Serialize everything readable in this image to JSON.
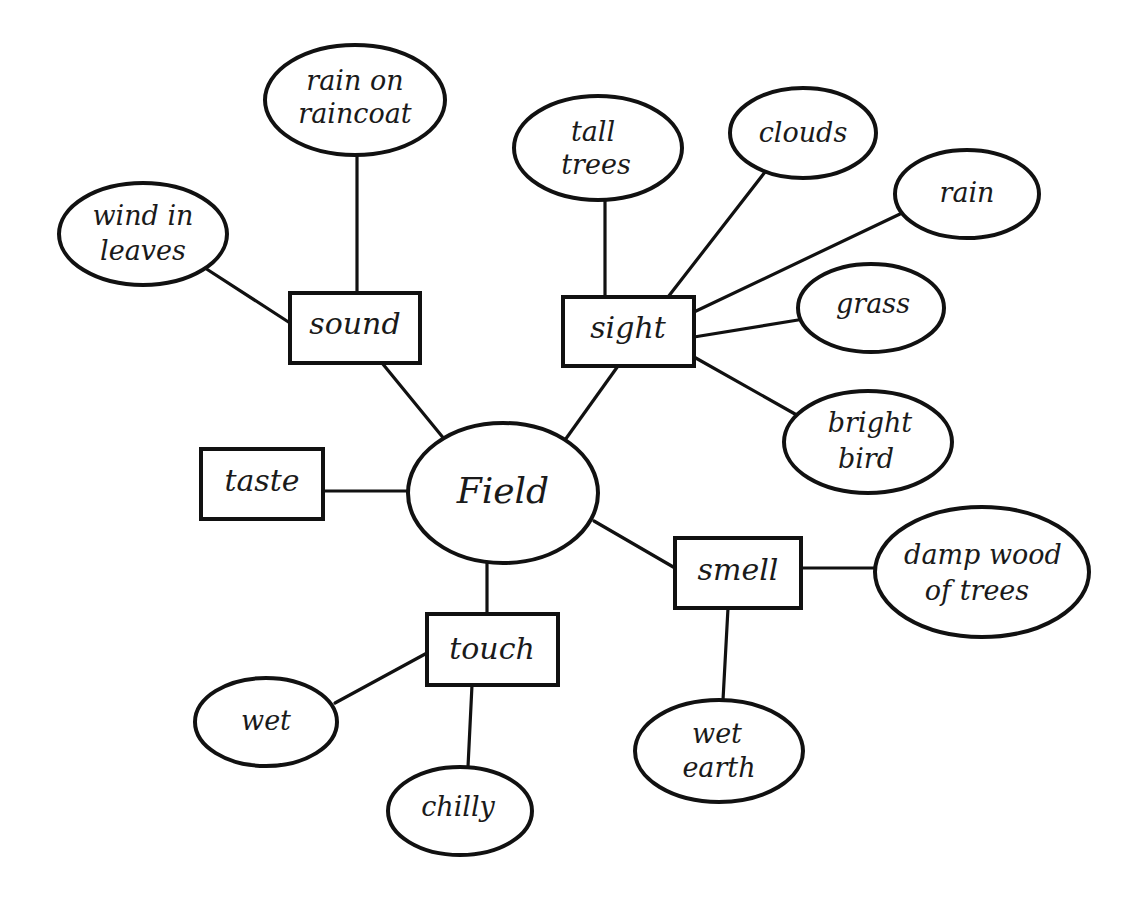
{
  "diagram": {
    "type": "concept-web",
    "center": {
      "id": "field",
      "label": "Field"
    },
    "categories": [
      {
        "id": "sound",
        "label": "sound"
      },
      {
        "id": "sight",
        "label": "sight"
      },
      {
        "id": "taste",
        "label": "taste"
      },
      {
        "id": "smell",
        "label": "smell"
      },
      {
        "id": "touch",
        "label": "touch"
      }
    ],
    "details": {
      "rain_on_raincoat": {
        "lines": [
          "rain on",
          "raincoat"
        ],
        "category": "sound"
      },
      "wind_in_leaves": {
        "lines": [
          "wind in",
          "leaves"
        ],
        "category": "sound"
      },
      "tall_trees": {
        "lines": [
          "tall",
          "trees"
        ],
        "category": "sight"
      },
      "clouds": {
        "lines": [
          "clouds"
        ],
        "category": "sight"
      },
      "rain": {
        "lines": [
          "rain"
        ],
        "category": "sight"
      },
      "grass": {
        "lines": [
          "grass"
        ],
        "category": "sight"
      },
      "bright_bird": {
        "lines": [
          "bright",
          "bird"
        ],
        "category": "sight"
      },
      "damp_wood": {
        "lines": [
          "damp wood",
          "of trees"
        ],
        "category": "smell"
      },
      "wet_earth": {
        "lines": [
          "wet",
          "earth"
        ],
        "category": "smell"
      },
      "wet": {
        "lines": [
          "wet"
        ],
        "category": "touch"
      },
      "chilly": {
        "lines": [
          "chilly"
        ],
        "category": "touch"
      }
    },
    "colors": {
      "ink": "#111111",
      "background": "#ffffff"
    }
  }
}
